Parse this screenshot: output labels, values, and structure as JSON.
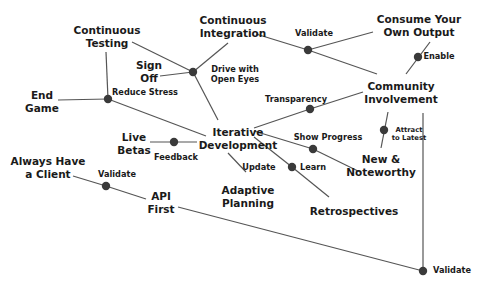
{
  "diagram": {
    "title": "",
    "colors": {
      "line": "#555555",
      "node": "#3a3a3a",
      "text": "#1a1a1a",
      "background": "#ffffff"
    },
    "concepts": [
      {
        "id": "continuous_testing",
        "lines": [
          "Continuous",
          "Testing"
        ],
        "x": 107,
        "y": 37,
        "size": "main"
      },
      {
        "id": "continuous_integration",
        "lines": [
          "Continuous",
          "Integration"
        ],
        "x": 233,
        "y": 27,
        "size": "main"
      },
      {
        "id": "consume_your_own_output",
        "lines": [
          "Consume Your",
          "Own Output"
        ],
        "x": 419,
        "y": 26,
        "size": "main"
      },
      {
        "id": "sign_off",
        "lines": [
          "Sign",
          "Off"
        ],
        "x": 149,
        "y": 72,
        "size": "main"
      },
      {
        "id": "end_game",
        "lines": [
          "End",
          "Game"
        ],
        "x": 42,
        "y": 102,
        "size": "main"
      },
      {
        "id": "community_involvement",
        "lines": [
          "Community",
          "Involvement"
        ],
        "x": 401,
        "y": 93,
        "size": "main"
      },
      {
        "id": "iterative_development",
        "lines": [
          "Iterative",
          "Development"
        ],
        "x": 238,
        "y": 139,
        "size": "main"
      },
      {
        "id": "live_betas",
        "lines": [
          "Live",
          "Betas"
        ],
        "x": 134,
        "y": 144,
        "size": "main"
      },
      {
        "id": "always_have_a_client",
        "lines": [
          "Always Have",
          "a Client"
        ],
        "x": 48,
        "y": 168,
        "size": "main"
      },
      {
        "id": "api_first",
        "lines": [
          "API",
          "First"
        ],
        "x": 161,
        "y": 203,
        "size": "main"
      },
      {
        "id": "adaptive_planning",
        "lines": [
          "Adaptive",
          "Planning"
        ],
        "x": 248,
        "y": 197,
        "size": "main"
      },
      {
        "id": "retrospectives",
        "lines": [
          "Retrospectives"
        ],
        "x": 354,
        "y": 211,
        "size": "main"
      },
      {
        "id": "new_and_noteworthy",
        "lines": [
          "New &",
          "Noteworthy"
        ],
        "x": 381,
        "y": 166,
        "size": "main"
      }
    ],
    "relations": [
      {
        "id": "reduce_stress",
        "lines": [
          "Reduce Stress"
        ],
        "x": 145,
        "y": 93,
        "size": "edge"
      },
      {
        "id": "drive_with_open_eyes",
        "lines": [
          "Drive with",
          "Open Eyes"
        ],
        "x": 235,
        "y": 75,
        "size": "edge"
      },
      {
        "id": "validate_ci",
        "lines": [
          "Validate"
        ],
        "x": 314,
        "y": 34,
        "size": "edge"
      },
      {
        "id": "enable",
        "lines": [
          "Enable"
        ],
        "x": 439,
        "y": 57,
        "size": "edge"
      },
      {
        "id": "transparency",
        "lines": [
          "Transparency"
        ],
        "x": 296,
        "y": 100,
        "size": "edge"
      },
      {
        "id": "show_progress",
        "lines": [
          "Show Progress"
        ],
        "x": 328,
        "y": 138,
        "size": "edge"
      },
      {
        "id": "attract_to_latest",
        "lines": [
          "Attract",
          "to Latest"
        ],
        "x": 409,
        "y": 134,
        "size": "tiny"
      },
      {
        "id": "feedback",
        "lines": [
          "Feedback"
        ],
        "x": 176,
        "y": 158,
        "size": "edge"
      },
      {
        "id": "update",
        "lines": [
          "Update"
        ],
        "x": 259,
        "y": 168,
        "size": "edge"
      },
      {
        "id": "learn",
        "lines": [
          "Learn"
        ],
        "x": 313,
        "y": 168,
        "size": "edge"
      },
      {
        "id": "validate_api",
        "lines": [
          "Validate"
        ],
        "x": 117,
        "y": 175,
        "size": "edge"
      },
      {
        "id": "validate_bottom",
        "lines": [
          "Validate"
        ],
        "x": 452,
        "y": 271,
        "size": "edge"
      }
    ],
    "nodes": [
      {
        "id": "hub_sign_off",
        "x": 193,
        "y": 72
      },
      {
        "id": "hub_reduce_stress",
        "x": 108,
        "y": 99
      },
      {
        "id": "hub_validate_ci",
        "x": 308,
        "y": 50
      },
      {
        "id": "hub_enable",
        "x": 418,
        "y": 57
      },
      {
        "id": "hub_transparency",
        "x": 310,
        "y": 109
      },
      {
        "id": "hub_feedback",
        "x": 174,
        "y": 142
      },
      {
        "id": "hub_show_progress",
        "x": 313,
        "y": 149
      },
      {
        "id": "hub_learn",
        "x": 292,
        "y": 167
      },
      {
        "id": "hub_attract",
        "x": 384,
        "y": 130
      },
      {
        "id": "hub_validate_api",
        "x": 106,
        "y": 186
      },
      {
        "id": "hub_validate_bottom",
        "x": 423,
        "y": 271
      }
    ],
    "edges": [
      {
        "x1": 132,
        "y1": 42,
        "x2": 193,
        "y2": 72
      },
      {
        "x1": 228,
        "y1": 43,
        "x2": 193,
        "y2": 72
      },
      {
        "x1": 160,
        "y1": 76,
        "x2": 193,
        "y2": 72
      },
      {
        "x1": 193,
        "y1": 72,
        "x2": 218,
        "y2": 120
      },
      {
        "x1": 106,
        "y1": 52,
        "x2": 108,
        "y2": 99
      },
      {
        "x1": 58,
        "y1": 100,
        "x2": 108,
        "y2": 99
      },
      {
        "x1": 108,
        "y1": 99,
        "x2": 206,
        "y2": 136
      },
      {
        "x1": 256,
        "y1": 34,
        "x2": 308,
        "y2": 50
      },
      {
        "x1": 308,
        "y1": 50,
        "x2": 373,
        "y2": 32
      },
      {
        "x1": 308,
        "y1": 50,
        "x2": 377,
        "y2": 74
      },
      {
        "x1": 430,
        "y1": 42,
        "x2": 406,
        "y2": 74
      },
      {
        "x1": 254,
        "y1": 128,
        "x2": 310,
        "y2": 109
      },
      {
        "x1": 310,
        "y1": 109,
        "x2": 363,
        "y2": 92
      },
      {
        "x1": 150,
        "y1": 142,
        "x2": 197,
        "y2": 142
      },
      {
        "x1": 254,
        "y1": 131,
        "x2": 313,
        "y2": 149
      },
      {
        "x1": 313,
        "y1": 149,
        "x2": 360,
        "y2": 172
      },
      {
        "x1": 254,
        "y1": 137,
        "x2": 292,
        "y2": 167
      },
      {
        "x1": 292,
        "y1": 167,
        "x2": 329,
        "y2": 197
      },
      {
        "x1": 228,
        "y1": 153,
        "x2": 246,
        "y2": 172
      },
      {
        "x1": 388,
        "y1": 112,
        "x2": 381,
        "y2": 148
      },
      {
        "x1": 73,
        "y1": 176,
        "x2": 106,
        "y2": 186
      },
      {
        "x1": 106,
        "y1": 186,
        "x2": 146,
        "y2": 199
      },
      {
        "x1": 178,
        "y1": 207,
        "x2": 423,
        "y2": 271
      },
      {
        "x1": 423,
        "y1": 113,
        "x2": 423,
        "y2": 271
      }
    ]
  }
}
